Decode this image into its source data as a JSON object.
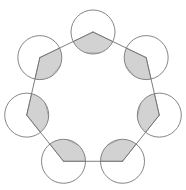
{
  "figure": {
    "title": "Regular heptagon with circles at each vertex and shaded interior angles",
    "caption": "",
    "background_color": "#ffffff",
    "canvas": {
      "width": 186,
      "height": 190
    }
  },
  "style": {
    "stroke_color": "#6f6f6f",
    "stroke_width": 0.9,
    "shade_fill": "#d2d2d2",
    "shade_stroke": "#8a8a8a",
    "circle_fill": "#ffffff",
    "circle_stroke": "#777777"
  },
  "chart_data": {
    "type": "diagram",
    "shape": "regular-polygon",
    "sides": 7,
    "polygon_name": "heptagon",
    "interior_angle_degrees": 128.571,
    "exterior_angle_degrees": 51.429,
    "interior_angle_sum_degrees": 900,
    "center": {
      "x": 93,
      "y": 100
    },
    "circumradius": 68,
    "vertex_circle_radius": 22,
    "start_angle_degrees": -90,
    "vertices": [
      {
        "id": "v1",
        "label": "top",
        "x": 93.0,
        "y": 32.0
      },
      {
        "id": "v2",
        "label": "upper-right",
        "x": 146.1,
        "y": 74.3
      },
      {
        "id": "v3",
        "label": "right",
        "x": 126.3,
        "y": 139.3
      },
      {
        "id": "v4",
        "label": "lower-right",
        "x": 59.7,
        "y": 139.3
      },
      {
        "id": "v5",
        "label": "lower-left",
        "x": 39.9,
        "y": 74.3
      },
      {
        "id": "v6",
        "label": "left",
        "x": 39.9,
        "y": 74.3
      },
      {
        "id": "v7",
        "label": "upper-left",
        "x": 39.9,
        "y": 74.3
      }
    ],
    "shaded_sectors": 7
  }
}
